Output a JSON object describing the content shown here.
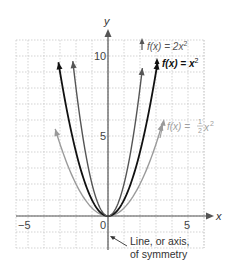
{
  "chart_data": {
    "type": "line",
    "title": "",
    "xlabel": "x",
    "ylabel": "y",
    "xlim": [
      -5.75,
      6
    ],
    "ylim": [
      -2,
      11
    ],
    "grid": true,
    "x_ticks": [
      {
        "value": -5,
        "label": "−5"
      },
      {
        "value": 0,
        "label": "0"
      },
      {
        "value": 5,
        "label": "5"
      }
    ],
    "y_ticks": [
      {
        "value": 5,
        "label": "5"
      },
      {
        "value": 10,
        "label": "10"
      }
    ],
    "series": [
      {
        "name": "f(x) = 2x²",
        "formula": "2x^2",
        "coef": 2,
        "color": "#555555",
        "x_range": [
          -2.2,
          2.15
        ]
      },
      {
        "name": "f(x) = x²",
        "formula": "x^2",
        "coef": 1,
        "color": "#111111",
        "x_range": [
          -3.1,
          3.1
        ]
      },
      {
        "name": "f(x) = ½x²",
        "formula": "0.5x^2",
        "coef": 0.5,
        "color": "#9a9a9a",
        "x_range": [
          -3.3,
          3.4
        ]
      }
    ],
    "annotations": [
      {
        "text_lines": [
          "Line, or axis,",
          "of symmetry"
        ],
        "points_to": "y-axis (x = 0)"
      }
    ]
  },
  "labels": {
    "axis_x": "x",
    "axis_y": "y",
    "tick_neg5": "−5",
    "tick_0": "0",
    "tick_5": "5",
    "tick_y5": "5",
    "tick_y10": "10",
    "label_2x2_prefix": "f(x) = 2x",
    "label_x2_prefix": "f(x) = x",
    "label_half_prefix": "f(x) = ",
    "label_half_num": "1",
    "label_half_den": "2",
    "label_half_var": "x",
    "sup2": "2",
    "annotation_line1": "Line, or axis,",
    "annotation_line2": "of symmetry"
  }
}
